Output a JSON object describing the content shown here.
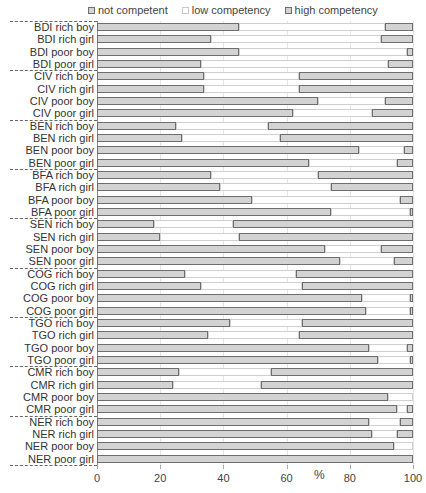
{
  "chart_data": {
    "type": "bar",
    "orientation": "horizontal",
    "stacked": true,
    "title": "",
    "xlabel": "%",
    "ylabel": "",
    "xlim": [
      0,
      100
    ],
    "x_ticks": [
      0,
      20,
      40,
      60,
      80,
      100
    ],
    "grid": "vertical",
    "legend_position": "top",
    "legend": [
      "not competent",
      "low competency",
      "high competency"
    ],
    "groups": [
      "BDI",
      "CIV",
      "BEN",
      "BFA",
      "SEN",
      "COG",
      "TGO",
      "CMR",
      "NER"
    ],
    "categories": [
      "BDI rich boy",
      "BDI rich girl",
      "BDI poor boy",
      "BDI poor girl",
      "CIV rich boy",
      "CIV rich girl",
      "CIV poor boy",
      "CIV poor girl",
      "BEN rich boy",
      "BEN rich girl",
      "BEN poor boy",
      "BEN poor girl",
      "BFA rich boy",
      "BFA rich girl",
      "BFA poor boy",
      "BFA poor girl",
      "SEN rich boy",
      "SEN rich girl",
      "SEN poor boy",
      "SEN poor girl",
      "COG rich boy",
      "COG rich girl",
      "COG poor boy",
      "COG poor girl",
      "TGO rich boy",
      "TGO rich girl",
      "TGO poor boy",
      "TGO poor girl",
      "CMR rich boy",
      "CMR rich girl",
      "CMR poor boy",
      "CMR poor girl",
      "NER rich boy",
      "NER rich girl",
      "NER poor boy",
      "NER poor girl"
    ],
    "series": [
      {
        "name": "not competent",
        "values": [
          45,
          36,
          45,
          33,
          34,
          34,
          70,
          62,
          25,
          27,
          83,
          67,
          36,
          39,
          49,
          74,
          18,
          20,
          72,
          77,
          28,
          33,
          84,
          85,
          42,
          35,
          86,
          89,
          26,
          24,
          92,
          95,
          86,
          87,
          94,
          100
        ]
      },
      {
        "name": "low competency",
        "values": [
          46,
          54,
          53,
          59,
          30,
          30,
          21,
          25,
          29,
          31,
          14,
          28,
          34,
          35,
          47,
          25,
          25,
          25,
          18,
          17,
          35,
          32,
          15,
          14,
          23,
          29,
          12,
          10,
          29,
          28,
          8,
          3,
          10,
          8,
          6,
          0
        ]
      },
      {
        "name": "high competency",
        "values": [
          9,
          10,
          2,
          8,
          36,
          36,
          9,
          13,
          46,
          42,
          3,
          5,
          30,
          26,
          4,
          1,
          57,
          55,
          10,
          6,
          37,
          35,
          1,
          1,
          35,
          36,
          2,
          1,
          45,
          48,
          0,
          2,
          4,
          5,
          0,
          0
        ]
      }
    ]
  },
  "colors": {
    "not_competent_fill": "#d3d3d3",
    "not_competent_border": "#6e6e6e",
    "low_competency_fill": "#ffffff",
    "low_competency_border": "#c8c8c8",
    "high_competency_fill": "#d3d3d3",
    "high_competency_border": "#6e6e6e"
  }
}
